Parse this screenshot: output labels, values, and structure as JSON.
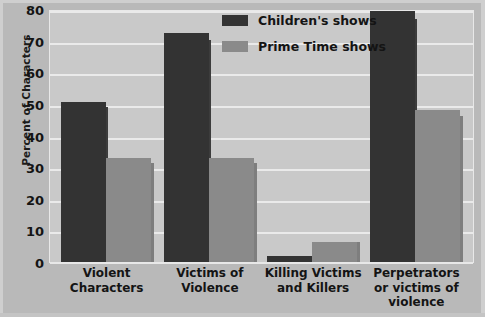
{
  "chart_data": {
    "type": "bar",
    "title": "",
    "xlabel": "",
    "ylabel": "Percent of Characters",
    "ylim": [
      0,
      80
    ],
    "ytick_labels": [
      "80",
      "70",
      "60",
      "50",
      "40",
      "30",
      "20",
      "10",
      "0"
    ],
    "ytick_values": [
      80,
      70,
      60,
      50,
      40,
      30,
      20,
      10,
      0
    ],
    "grid": true,
    "legend_position": "top-center-right",
    "categories": [
      "Violent Characters",
      "Victims of Violence",
      "Killing Victims and Killers",
      "Perpetrators or victims of violence"
    ],
    "category_lines": [
      [
        "Violent",
        "Characters"
      ],
      [
        "Victims of",
        "Violence"
      ],
      [
        "Killing Victims",
        "and Killers"
      ],
      [
        "Perpetrators",
        "or victims of",
        "violence"
      ]
    ],
    "series": [
      {
        "name": "Children's shows",
        "color": "#333333",
        "values": [
          51,
          73,
          2,
          80
        ]
      },
      {
        "name": "Prime Time shows",
        "color": "#8a8a8a",
        "values": [
          33,
          33,
          6.5,
          48.5
        ]
      }
    ],
    "colors": {
      "plot_background": "#c9c9c9",
      "figure_background": "#b9b9b9",
      "gridline": "#eaeaea",
      "text": "#141414"
    }
  }
}
